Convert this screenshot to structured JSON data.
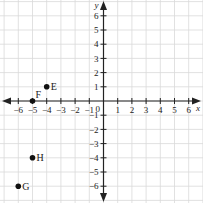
{
  "diagram": {
    "type": "coordinate-plane",
    "axes": {
      "x_label": "x",
      "y_label": "y",
      "x_range": [
        -6,
        6
      ],
      "y_range": [
        -6,
        6
      ],
      "origin_label": "0",
      "x_ticks": [
        "-6",
        "-5",
        "-4",
        "-3",
        "-2",
        "-1",
        "1",
        "2",
        "3",
        "4",
        "5",
        "6"
      ],
      "y_ticks": [
        "6",
        "5",
        "4",
        "3",
        "2",
        "1",
        "-1",
        "-2",
        "-3",
        "-4",
        "-5",
        "-6"
      ]
    },
    "points": [
      {
        "label": "E",
        "x": -4,
        "y": 1
      },
      {
        "label": "F",
        "x": -5,
        "y": 0
      },
      {
        "label": "H",
        "x": -5,
        "y": -4
      },
      {
        "label": "G",
        "x": -6,
        "y": -6
      }
    ],
    "colors": {
      "grid": "#d9d9d9",
      "axis": "#222222",
      "point": "#111111"
    }
  }
}
